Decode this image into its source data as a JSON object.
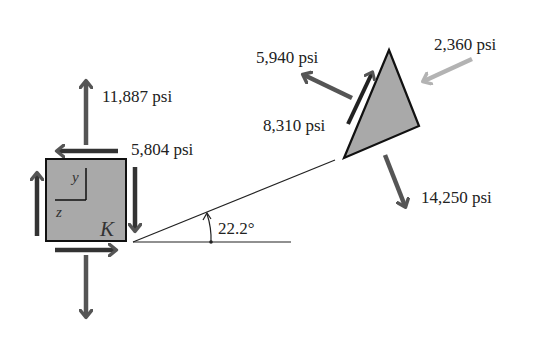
{
  "diagram": {
    "element_label": "K",
    "axes": {
      "vertical": "y",
      "horizontal": "z"
    },
    "angle_label": "22.2°",
    "stresses": {
      "normal_y": "11,887 psi",
      "shear_yz": "5,804 psi",
      "incline_normal_out": "5,940 psi",
      "incline_shear": "8,310 psi",
      "incline_compressive": "2,360 psi",
      "incline_tensile": "14,250 psi"
    },
    "colors": {
      "element_fill": "#a9a9a9",
      "arrow_dark": "#555555",
      "arrow_light": "#b3b3b3",
      "outline": "#111111"
    }
  }
}
